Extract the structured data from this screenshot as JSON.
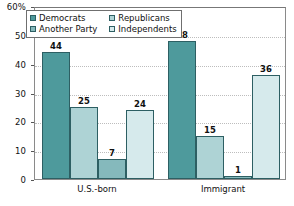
{
  "chart_data": {
    "type": "bar",
    "title": "",
    "subtitle": "",
    "xlabel": "",
    "ylabel": "",
    "categories": [
      "U.S.-born",
      "Immigrant"
    ],
    "series": [
      {
        "name": "Democrats",
        "values": [
          44,
          48
        ],
        "color": "#4e9a9c"
      },
      {
        "name": "Republicans",
        "values": [
          25,
          15
        ],
        "color": "#aed3d5"
      },
      {
        "name": "Another Party",
        "values": [
          7,
          1
        ],
        "color": "#85b9bc"
      },
      {
        "name": "Independents",
        "values": [
          24,
          36
        ],
        "color": "#d6eaec"
      }
    ],
    "ylim": [
      0,
      60
    ],
    "yticks": [
      0,
      10,
      20,
      30,
      40,
      50,
      60
    ],
    "ytick_labels": [
      "0",
      "10",
      "20",
      "30",
      "40",
      "50",
      "60%"
    ],
    "grid": true,
    "legend_position": "top-left",
    "data_labels": true
  },
  "axis_colors": {
    "gridline": "#bdbdbd",
    "frame": "#8a8a8a",
    "bar_outline": "#2d5f63",
    "text": "#111111"
  }
}
